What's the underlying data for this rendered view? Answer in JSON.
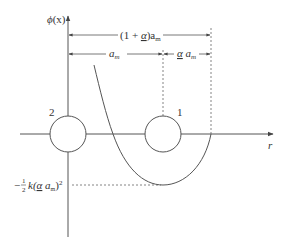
{
  "diagram": {
    "type": "potential-energy-diagram",
    "colors": {
      "line": "#555555",
      "text": "#333333",
      "background": "#ffffff"
    },
    "y_axis": {
      "label_fn": "ϕ",
      "label_arg": "(x)"
    },
    "x_axis": {
      "label": "r"
    },
    "dimensions": {
      "total": {
        "prefix": "(1 + ",
        "alpha": "α",
        "suffix": ")a",
        "sub": "m"
      },
      "left": {
        "text": "a",
        "sub": "m"
      },
      "right": {
        "alpha": "α",
        "text": " a",
        "sub": "m"
      }
    },
    "atoms": [
      {
        "id": "2",
        "label": "2"
      },
      {
        "id": "1",
        "label": "1"
      }
    ],
    "min_value_label": {
      "minus": "−",
      "frac_num": "1",
      "frac_den": "2",
      "k": "k(",
      "alpha": "α",
      "a": " a",
      "sub": "m",
      "close": ")",
      "sup": "2"
    }
  }
}
